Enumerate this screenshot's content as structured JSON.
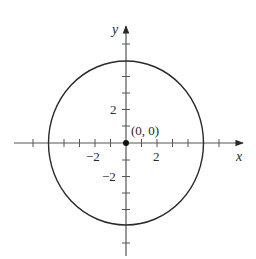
{
  "figure": {
    "center_label": "(0, 0)",
    "x_axis_label": "x",
    "y_axis_label": "y",
    "x_tick_labels": {
      "neg": "−2",
      "pos": "2"
    },
    "y_tick_labels": {
      "pos": "2",
      "neg": "−2"
    },
    "circle": {
      "center": [
        0,
        0
      ],
      "radius": 5
    },
    "x_range": [
      -7,
      7
    ],
    "y_range": [
      -7,
      7
    ],
    "tick_spacing": 1,
    "colors": {
      "stroke": "#2a2a2a",
      "axis": "#555555",
      "background": "#ffffff"
    }
  }
}
